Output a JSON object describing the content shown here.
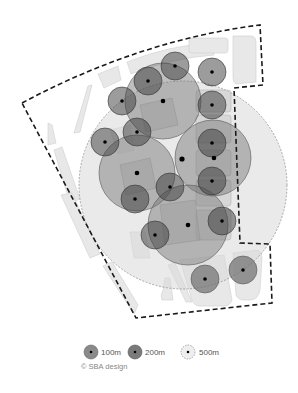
{
  "diagram": {
    "boundary_color": "#222222",
    "block_fill": "#e6e6e6",
    "block_stroke": "#c8c8c8"
  },
  "legend": {
    "items": [
      {
        "label": "100m",
        "type": "100m"
      },
      {
        "label": "200m",
        "type": "200m"
      },
      {
        "label": "500m",
        "type": "500m"
      }
    ],
    "credit": "© SBA design"
  }
}
